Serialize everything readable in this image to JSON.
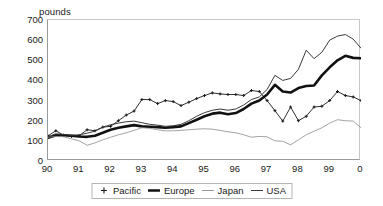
{
  "chart_data": {
    "type": "line",
    "title": "",
    "ylabel": "pounds",
    "xlabel": "",
    "ylim": [
      0,
      700
    ],
    "yticks": [
      0,
      100,
      200,
      300,
      400,
      500,
      600,
      700
    ],
    "xticks": [
      "90",
      "91",
      "92",
      "93",
      "94",
      "95",
      "96",
      "97",
      "98",
      "99",
      "0"
    ],
    "xlim": [
      1990,
      2000
    ],
    "grid": false,
    "legend_position": "bottom",
    "x": [
      1990,
      1990.25,
      1990.5,
      1990.75,
      1991,
      1991.25,
      1991.5,
      1991.75,
      1992,
      1992.25,
      1992.5,
      1992.75,
      1993,
      1993.25,
      1993.5,
      1993.75,
      1994,
      1994.25,
      1994.5,
      1994.75,
      1995,
      1995.25,
      1995.5,
      1995.75,
      1996,
      1996.25,
      1996.5,
      1996.75,
      1997,
      1997.25,
      1997.5,
      1997.75,
      1998,
      1998.25,
      1998.5,
      1998.75,
      1999,
      1999.25,
      1999.5,
      1999.75,
      2000
    ],
    "series": [
      {
        "name": "Pacific",
        "marker": "plus",
        "width": 0.9,
        "color": "#1a1a1a",
        "values": [
          125,
          150,
          128,
          122,
          126,
          155,
          150,
          168,
          172,
          200,
          228,
          248,
          305,
          305,
          285,
          300,
          295,
          275,
          292,
          310,
          325,
          338,
          333,
          330,
          330,
          325,
          350,
          345,
          300,
          250,
          198,
          268,
          200,
          222,
          268,
          272,
          300,
          345,
          325,
          318,
          300
        ]
      },
      {
        "name": "Europe",
        "marker": "none",
        "width": 2.6,
        "color": "#111111",
        "values": [
          115,
          128,
          128,
          125,
          122,
          120,
          125,
          140,
          155,
          165,
          172,
          178,
          172,
          170,
          168,
          165,
          168,
          172,
          188,
          205,
          222,
          235,
          240,
          232,
          238,
          258,
          285,
          300,
          330,
          378,
          345,
          340,
          362,
          372,
          375,
          425,
          465,
          500,
          522,
          512,
          510
        ]
      },
      {
        "name": "Japan",
        "marker": "none",
        "width": 0.8,
        "color": "#8c8c8c",
        "values": [
          118,
          122,
          120,
          110,
          100,
          78,
          90,
          105,
          118,
          130,
          140,
          152,
          165,
          162,
          155,
          150,
          150,
          152,
          155,
          158,
          160,
          158,
          152,
          145,
          140,
          130,
          118,
          122,
          120,
          100,
          98,
          80,
          105,
          130,
          148,
          165,
          188,
          205,
          200,
          198,
          165
        ]
      },
      {
        "name": "USA",
        "marker": "none",
        "width": 1.0,
        "color": "#3a3a3a",
        "values": [
          120,
          135,
          132,
          128,
          130,
          138,
          148,
          168,
          180,
          188,
          195,
          198,
          190,
          182,
          178,
          172,
          175,
          182,
          200,
          222,
          240,
          252,
          258,
          252,
          258,
          278,
          305,
          318,
          355,
          425,
          400,
          410,
          455,
          550,
          508,
          540,
          600,
          620,
          628,
          605,
          560
        ]
      }
    ]
  },
  "legend": {
    "items": [
      {
        "label": "Pacific",
        "key": "plus"
      },
      {
        "label": "Europe",
        "key": "thick"
      },
      {
        "label": "Japan",
        "key": "light"
      },
      {
        "label": "USA",
        "key": "medium"
      }
    ]
  },
  "colors": {
    "pacific": "#1a1a1a",
    "europe": "#111111",
    "japan": "#8c8c8c",
    "usa": "#3a3a3a",
    "axis": "#9a9a9a",
    "frame_light": "#c8c8c8",
    "text": "#1a1a1a"
  }
}
